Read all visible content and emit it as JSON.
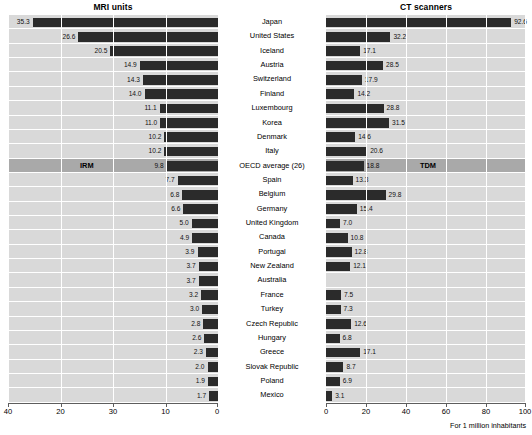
{
  "footnote": "For 1 million inhabitants",
  "panels": {
    "mri": {
      "title": "MRI units",
      "inline_tag": "IRM"
    },
    "ct": {
      "title": "CT scanners",
      "inline_tag": "TDM"
    }
  },
  "axes": {
    "mri": {
      "labels": [
        "40",
        "20",
        "30",
        "10",
        "0"
      ],
      "min": 0,
      "max": 40,
      "reversed": true
    },
    "ct": {
      "labels": [
        "0",
        "20",
        "40",
        "60",
        "80",
        "100"
      ],
      "min": 0,
      "max": 100,
      "reversed": false
    }
  },
  "chart_data": {
    "type": "bar",
    "subtitle": "For 1 million inhabitants",
    "orientation": "horizontal",
    "layout": "back-to-back paired panels with shared centered category labels",
    "xlabel": "",
    "ylabel": "",
    "grid": true,
    "legend": "none",
    "highlight_category": "OECD average (26)",
    "categories": [
      "Japan",
      "United States",
      "Iceland",
      "Austria",
      "Switzerland",
      "Finland",
      "Luxembourg",
      "Korea",
      "Denmark",
      "Italy",
      "OECD average (26)",
      "Spain",
      "Belgium",
      "Germany",
      "United Kingdom",
      "Canada",
      "Portugal",
      "New Zealand",
      "Australia",
      "France",
      "Turkey",
      "Czech Republic",
      "Hungary",
      "Greece",
      "Slovak Republic",
      "Poland",
      "Mexico"
    ],
    "series": [
      {
        "name": "MRI units",
        "local_name": "IRM",
        "panel": "left",
        "xlim": [
          0,
          40
        ],
        "axis_ticks": [
          "40",
          "20",
          "30",
          "10",
          "0"
        ],
        "values": [
          35.3,
          26.6,
          20.5,
          14.9,
          14.3,
          14.0,
          11.1,
          11.0,
          10.2,
          10.2,
          9.8,
          7.7,
          6.8,
          6.6,
          5.0,
          4.9,
          3.9,
          3.7,
          3.7,
          3.2,
          3.0,
          2.8,
          2.6,
          2.3,
          2.0,
          1.9,
          1.7
        ],
        "labels": [
          "35.3",
          "26.6",
          "20.5",
          "14.9",
          "14.3",
          "14.0",
          "11.1",
          "11.0",
          "10.2",
          "10.2",
          "9.8",
          "7.7",
          "6.8",
          "6.6",
          "5.0",
          "4.9",
          "3.9",
          "3.7",
          "3.7",
          "3.2",
          "3.0",
          "2.8",
          "2.6",
          "2.3",
          "2.0",
          "1.9",
          "1.7"
        ]
      },
      {
        "name": "CT scanners",
        "local_name": "TDM",
        "panel": "right",
        "xlim": [
          0,
          100
        ],
        "axis_ticks": [
          "0",
          "20",
          "40",
          "60",
          "80",
          "100"
        ],
        "values": [
          92.6,
          32.2,
          17.1,
          28.5,
          17.9,
          14.2,
          28.8,
          31.5,
          14.6,
          20.6,
          18.8,
          13.3,
          29.8,
          15.4,
          7.0,
          10.8,
          12.8,
          12.1,
          null,
          7.5,
          7.3,
          12.6,
          6.8,
          17.1,
          8.7,
          6.9,
          3.1
        ],
        "labels": [
          "92.6",
          "32.2",
          "17.1",
          "28.5",
          "17.9",
          "14.2",
          "28.8",
          "31.5",
          "14.6",
          "20.6",
          "18.8",
          "13.3",
          "29.8",
          "15.4",
          "7.0",
          "10.8",
          "12.8",
          "12.1",
          "",
          "7.5",
          "7.3",
          "12.6",
          "6.8",
          "17.1",
          "8.7",
          "6.9",
          "3.1"
        ]
      }
    ]
  }
}
